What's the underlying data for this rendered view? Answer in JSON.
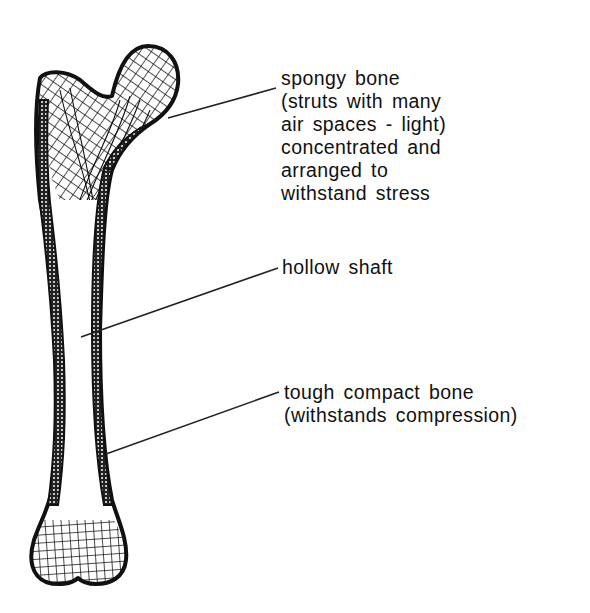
{
  "diagram": {
    "colors": {
      "ink": "#111111",
      "background": "#ffffff"
    },
    "labels": [
      {
        "id": "spongy-bone",
        "lines": [
          "spongy bone",
          "(struts with many",
          "air spaces - light)",
          "concentrated and",
          "arranged to",
          "withstand stress"
        ]
      },
      {
        "id": "hollow-shaft",
        "lines": [
          "hollow shaft"
        ]
      },
      {
        "id": "compact-bone",
        "lines": [
          "tough compact bone",
          "(withstands compression)"
        ]
      }
    ]
  }
}
